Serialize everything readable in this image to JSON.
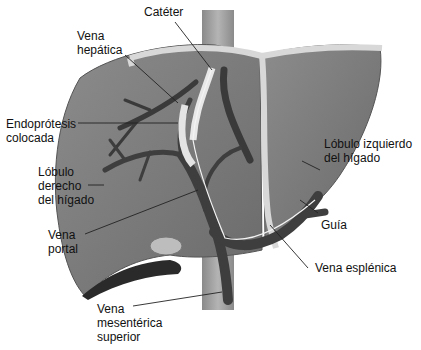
{
  "figure": {
    "colors": {
      "liver_fill": "#7a7a7a",
      "liver_dark": "#5a5a5a",
      "vein_fill": "#3e3e3e",
      "vena_cava": "#9a9a9a",
      "ligament": "#d6d6d6",
      "stent": "#e4e4e4",
      "background": "#ffffff",
      "leader_line": "#222222"
    },
    "labels": {
      "cateter": "Catéter",
      "vena_hepatica_1": "Vena",
      "vena_hepatica_2": "hepática",
      "endoprotesis_1": "Endoprótesis",
      "endoprotesis_2": "colocada",
      "lobulo_derecho_1": "Lóbulo",
      "lobulo_derecho_2": "derecho",
      "lobulo_derecho_3": "del hígado",
      "vena_portal_1": "Vena",
      "vena_portal_2": "portal",
      "vena_mesenterica_1": "Vena",
      "vena_mesenterica_2": "mesentérica",
      "vena_mesenterica_3": "superior",
      "lobulo_izquierdo_1": "Lóbulo izquierdo",
      "lobulo_izquierdo_2": "del hígado",
      "guia": "Guía",
      "vena_esplenica": "Vena esplénica"
    }
  }
}
